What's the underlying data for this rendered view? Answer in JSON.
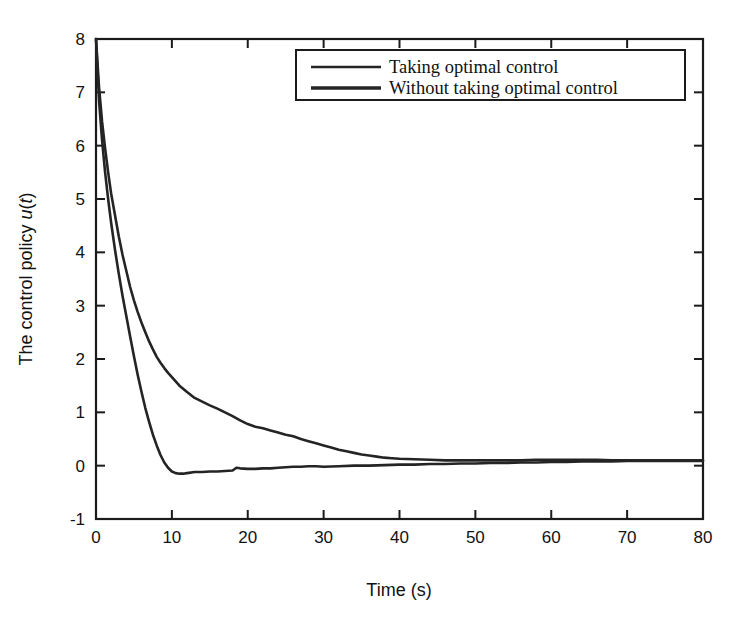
{
  "chart_data": {
    "type": "line",
    "title": "",
    "xlabel": "Time (s)",
    "ylabel": "The control policy u(t)",
    "ylabel_parts": {
      "text": "The control policy ",
      "italic_u": "u",
      "paren_open": "(",
      "italic_t": "t",
      "paren_close": ")"
    },
    "xlim": [
      0,
      80
    ],
    "ylim": [
      -1,
      8
    ],
    "xticks": [
      0,
      10,
      20,
      30,
      40,
      50,
      60,
      70,
      80
    ],
    "yticks": [
      -1,
      0,
      1,
      2,
      3,
      4,
      5,
      6,
      7,
      8
    ],
    "xtick_labels": [
      "0",
      "10",
      "20",
      "30",
      "40",
      "50",
      "60",
      "70",
      "80"
    ],
    "ytick_labels": [
      "-1",
      "0",
      "1",
      "2",
      "3",
      "4",
      "5",
      "6",
      "7",
      "8"
    ],
    "grid": false,
    "frame": "box-all-sides-inward-ticks",
    "legend": {
      "position": "top-center-inside",
      "entries": [
        {
          "name": "Taking optimal control",
          "color": "#242424",
          "linewidth": 2.3
        },
        {
          "name": "Without taking optimal control",
          "color": "#242424",
          "linewidth": 3.4
        }
      ]
    },
    "series": [
      {
        "name": "Taking optimal control",
        "color": "#242424",
        "x": [
          0,
          0.4,
          0.8,
          1.2,
          1.6,
          2.0,
          2.5,
          3.0,
          3.5,
          4.0,
          4.5,
          5.0,
          5.5,
          6.0,
          6.5,
          7.0,
          7.5,
          8.0,
          8.5,
          9.0,
          9.5,
          10.0,
          11.0,
          12.0,
          13.0,
          14.0,
          15.0,
          16.0,
          17.0,
          18.0,
          19.0,
          20.0,
          21.0,
          22.0,
          23.0,
          24.0,
          25.0,
          26.0,
          27.0,
          28.0,
          29.0,
          30.0,
          31.0,
          32.0,
          33.0,
          34.0,
          35.0,
          36.0,
          37.0,
          38.0,
          39.0,
          40.0,
          42.0,
          44.0,
          46.0,
          48.0,
          50.0,
          52.0,
          54.0,
          56.0,
          58.0,
          60.0,
          62.0,
          64.0,
          66.0,
          68.0,
          70.0,
          72.0,
          74.0,
          76.0,
          78.0,
          80.0
        ],
        "y": [
          8.0,
          7.1,
          6.45,
          5.95,
          5.5,
          5.1,
          4.7,
          4.3,
          3.95,
          3.65,
          3.35,
          3.1,
          2.88,
          2.68,
          2.5,
          2.33,
          2.18,
          2.04,
          1.93,
          1.83,
          1.74,
          1.66,
          1.5,
          1.38,
          1.27,
          1.2,
          1.13,
          1.07,
          1.0,
          0.93,
          0.85,
          0.78,
          0.73,
          0.7,
          0.66,
          0.62,
          0.58,
          0.55,
          0.5,
          0.46,
          0.42,
          0.38,
          0.34,
          0.3,
          0.27,
          0.24,
          0.21,
          0.19,
          0.17,
          0.15,
          0.14,
          0.13,
          0.12,
          0.11,
          0.1,
          0.1,
          0.1,
          0.1,
          0.1,
          0.1,
          0.11,
          0.11,
          0.11,
          0.11,
          0.11,
          0.1,
          0.1,
          0.1,
          0.1,
          0.1,
          0.1,
          0.1
        ]
      },
      {
        "name": "Without taking optimal control",
        "color": "#242424",
        "x": [
          0,
          0.4,
          0.8,
          1.2,
          1.6,
          2.0,
          2.5,
          3.0,
          3.5,
          4.0,
          4.5,
          5.0,
          5.5,
          6.0,
          6.5,
          7.0,
          7.5,
          8.0,
          8.5,
          9.0,
          9.5,
          10.0,
          10.5,
          11.0,
          11.5,
          12.0,
          13.0,
          14.0,
          15.0,
          16.0,
          17.0,
          18.0,
          18.5,
          19.0,
          20.0,
          21.0,
          22.0,
          23.0,
          24.0,
          25.0,
          26.0,
          27.0,
          28.0,
          29.0,
          30.0,
          32.0,
          34.0,
          36.0,
          38.0,
          40.0,
          42.0,
          44.0,
          46.0,
          48.0,
          50.0,
          52.0,
          54.0,
          56.0,
          58.0,
          60.0,
          62.0,
          64.0,
          66.0,
          68.0,
          70.0,
          72.0,
          74.0,
          76.0,
          78.0,
          80.0
        ],
        "y": [
          8.0,
          6.85,
          6.1,
          5.5,
          5.0,
          4.55,
          4.05,
          3.6,
          3.18,
          2.8,
          2.42,
          2.05,
          1.7,
          1.38,
          1.08,
          0.82,
          0.58,
          0.38,
          0.2,
          0.06,
          -0.04,
          -0.11,
          -0.14,
          -0.15,
          -0.15,
          -0.14,
          -0.12,
          -0.12,
          -0.11,
          -0.11,
          -0.1,
          -0.09,
          -0.04,
          -0.05,
          -0.06,
          -0.06,
          -0.05,
          -0.05,
          -0.04,
          -0.03,
          -0.02,
          -0.02,
          -0.01,
          -0.01,
          -0.02,
          -0.01,
          0.0,
          0.0,
          0.01,
          0.02,
          0.02,
          0.03,
          0.03,
          0.04,
          0.04,
          0.05,
          0.05,
          0.06,
          0.06,
          0.07,
          0.07,
          0.08,
          0.08,
          0.08,
          0.09,
          0.09,
          0.09,
          0.09,
          0.09,
          0.09
        ]
      }
    ]
  },
  "colors": {
    "line": "#242424",
    "axis": "#1b1b1b",
    "text": "#121212",
    "background": "#ffffff"
  }
}
